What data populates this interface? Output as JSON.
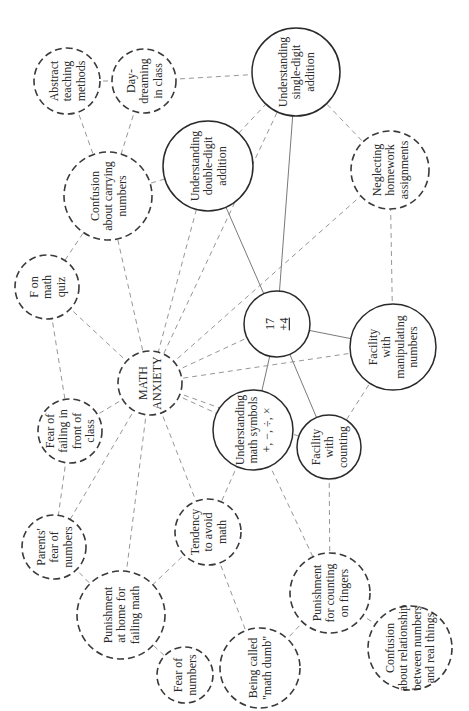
{
  "diagram": {
    "orientation": "rotated -90deg",
    "nodes": [
      {
        "id": "abstract",
        "lines": [
          "Abstract",
          "teaching",
          "methods"
        ],
        "style": "dashed",
        "cx": 67,
        "cy": 81,
        "r": 33
      },
      {
        "id": "daydream",
        "lines": [
          "Day-",
          "dreaming",
          "in class"
        ],
        "style": "dashed",
        "cx": 144,
        "cy": 81,
        "r": 32
      },
      {
        "id": "single",
        "lines": [
          "Understanding",
          "single-digit",
          "addition"
        ],
        "style": "solid",
        "cx": 296,
        "cy": 72,
        "r": 44
      },
      {
        "id": "carrying",
        "lines": [
          "Confusion",
          "about carrying",
          "numbers"
        ],
        "style": "dashed",
        "cx": 108,
        "cy": 196,
        "r": 44
      },
      {
        "id": "double",
        "lines": [
          "Understanding",
          "double-digit",
          "addition"
        ],
        "style": "solid",
        "cx": 208,
        "cy": 166,
        "r": 45
      },
      {
        "id": "homework",
        "lines": [
          "Neglecting",
          "homework",
          "assignments"
        ],
        "style": "dashed",
        "cx": 390,
        "cy": 170,
        "r": 39
      },
      {
        "id": "fquiz",
        "lines": [
          "F on",
          "math",
          "quiz"
        ],
        "style": "dashed",
        "cx": 47,
        "cy": 287,
        "r": 32
      },
      {
        "id": "problem",
        "lines": [
          "17",
          "+4"
        ],
        "style": "solid",
        "cx": 277,
        "cy": 324,
        "r": 33
      },
      {
        "id": "manip",
        "lines": [
          "Facility",
          "with",
          "manipulating",
          "numbers"
        ],
        "style": "solid",
        "cx": 393,
        "cy": 347,
        "r": 43
      },
      {
        "id": "anxiety",
        "lines": [
          "MATH",
          "ANXIETY"
        ],
        "style": "dashed",
        "cx": 150,
        "cy": 383,
        "r": 32
      },
      {
        "id": "failclass",
        "lines": [
          "Fear of",
          "failing in",
          "front of",
          "class"
        ],
        "style": "dashed",
        "cx": 70,
        "cy": 431,
        "r": 32
      },
      {
        "id": "symbols",
        "lines": [
          "Understanding",
          "math symbols",
          "+, −, ÷, ×"
        ],
        "style": "solid",
        "cx": 253,
        "cy": 430,
        "r": 40
      },
      {
        "id": "counting",
        "lines": [
          "Facility",
          "with",
          "counting"
        ],
        "style": "solid",
        "cx": 329,
        "cy": 447,
        "r": 32
      },
      {
        "id": "avoid",
        "lines": [
          "Tendency",
          "to avoid",
          "math"
        ],
        "style": "dashed",
        "cx": 208,
        "cy": 532,
        "r": 33
      },
      {
        "id": "parents",
        "lines": [
          "Parents'",
          "fear of",
          "numbers"
        ],
        "style": "dashed",
        "cx": 54,
        "cy": 547,
        "r": 32
      },
      {
        "id": "punishhome",
        "lines": [
          "Punishment",
          "at home for",
          "failing math"
        ],
        "style": "dashed",
        "cx": 121,
        "cy": 615,
        "r": 44
      },
      {
        "id": "punishfingers",
        "lines": [
          "Punishment",
          "for counting",
          "on fingers"
        ],
        "style": "dashed",
        "cx": 330,
        "cy": 593,
        "r": 40
      },
      {
        "id": "fearnum",
        "lines": [
          "Fear of",
          "numbers"
        ],
        "style": "dashed",
        "cx": 185,
        "cy": 675,
        "r": 28
      },
      {
        "id": "dumb",
        "lines": [
          "Being called",
          "\"math dumb\""
        ],
        "style": "dashed",
        "cx": 260,
        "cy": 668,
        "r": 40
      },
      {
        "id": "relation",
        "lines": [
          "Confusion",
          "about relationship",
          "between numbers",
          "and real things"
        ],
        "style": "dashed",
        "cx": 410,
        "cy": 648,
        "r": 42
      }
    ],
    "edges": [
      {
        "from": "abstract",
        "to": "daydream",
        "style": "dashed"
      },
      {
        "from": "abstract",
        "to": "carrying",
        "style": "dashed"
      },
      {
        "from": "daydream",
        "to": "carrying",
        "style": "dashed"
      },
      {
        "from": "daydream",
        "to": "single",
        "style": "dashed"
      },
      {
        "from": "carrying",
        "to": "double",
        "style": "dashed"
      },
      {
        "from": "carrying",
        "to": "fquiz",
        "style": "dashed"
      },
      {
        "from": "carrying",
        "to": "anxiety",
        "style": "dashed"
      },
      {
        "from": "double",
        "to": "single",
        "style": "dashed"
      },
      {
        "from": "double",
        "to": "problem",
        "style": "solid"
      },
      {
        "from": "double",
        "to": "anxiety",
        "style": "dashed"
      },
      {
        "from": "single",
        "to": "problem",
        "style": "solid"
      },
      {
        "from": "single",
        "to": "homework",
        "style": "dashed"
      },
      {
        "from": "single",
        "to": "anxiety",
        "style": "dashed"
      },
      {
        "from": "homework",
        "to": "manip",
        "style": "dashed"
      },
      {
        "from": "homework",
        "to": "anxiety",
        "style": "dashed"
      },
      {
        "from": "fquiz",
        "to": "anxiety",
        "style": "dashed"
      },
      {
        "from": "fquiz",
        "to": "failclass",
        "style": "dashed"
      },
      {
        "from": "problem",
        "to": "manip",
        "style": "solid"
      },
      {
        "from": "problem",
        "to": "symbols",
        "style": "solid"
      },
      {
        "from": "problem",
        "to": "counting",
        "style": "solid"
      },
      {
        "from": "problem",
        "to": "anxiety",
        "style": "dashed"
      },
      {
        "from": "manip",
        "to": "anxiety",
        "style": "dashed"
      },
      {
        "from": "manip",
        "to": "counting",
        "style": "dashed"
      },
      {
        "from": "anxiety",
        "to": "failclass",
        "style": "dashed"
      },
      {
        "from": "anxiety",
        "to": "counting",
        "style": "dashed"
      },
      {
        "from": "anxiety",
        "to": "symbols",
        "style": "dashed"
      },
      {
        "from": "anxiety",
        "to": "avoid",
        "style": "dashed"
      },
      {
        "from": "anxiety",
        "to": "parents",
        "style": "dashed"
      },
      {
        "from": "anxiety",
        "to": "punishhome",
        "style": "dashed"
      },
      {
        "from": "failclass",
        "to": "parents",
        "style": "dashed"
      },
      {
        "from": "symbols",
        "to": "avoid",
        "style": "dashed"
      },
      {
        "from": "symbols",
        "to": "punishfingers",
        "style": "dashed"
      },
      {
        "from": "counting",
        "to": "punishfingers",
        "style": "dashed"
      },
      {
        "from": "avoid",
        "to": "punishhome",
        "style": "dashed"
      },
      {
        "from": "avoid",
        "to": "dumb",
        "style": "dashed"
      },
      {
        "from": "parents",
        "to": "punishhome",
        "style": "dashed"
      },
      {
        "from": "punishhome",
        "to": "fearnum",
        "style": "dashed"
      },
      {
        "from": "punishfingers",
        "to": "dumb",
        "style": "dashed"
      },
      {
        "from": "punishfingers",
        "to": "relation",
        "style": "dashed"
      }
    ]
  }
}
